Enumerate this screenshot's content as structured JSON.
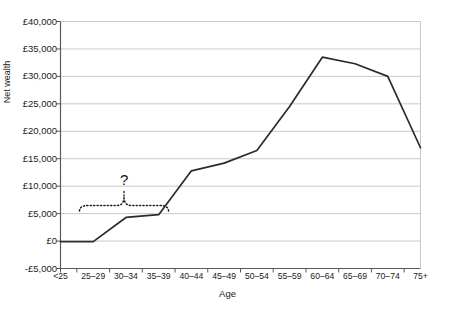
{
  "chart_data": {
    "type": "line",
    "title": "",
    "xlabel": "Age",
    "ylabel": "Net wealth",
    "categories": [
      "<25",
      "25–29",
      "30–34",
      "35–39",
      "40–44",
      "45–49",
      "50–54",
      "55–59",
      "60–64",
      "65–69",
      "70–74",
      "75+"
    ],
    "values": [
      -100,
      -100,
      4300,
      4800,
      12800,
      14200,
      16500,
      24500,
      33500,
      32300,
      30000,
      17000
    ],
    "series": [
      {
        "name": "Net wealth",
        "values": [
          -100,
          -100,
          4300,
          4800,
          12800,
          14200,
          16500,
          24500,
          33500,
          32300,
          30000,
          17000
        ]
      }
    ],
    "ylim": [
      -5000,
      40000
    ],
    "ytick_values": [
      40000,
      35000,
      30000,
      25000,
      20000,
      15000,
      10000,
      5000,
      0,
      -5000
    ],
    "ytick_labels": [
      "£40,000",
      "£35,000",
      "£30,000",
      "£25,000",
      "£20,000",
      "£15,000",
      "£10,000",
      "£5,000",
      "£0",
      "-£5,000"
    ],
    "grid": true,
    "legend": "none",
    "line_color": "#2b2b2b",
    "grid_color": "#c8c8c8",
    "axis_color": "#6b6b6b",
    "annotations": [
      {
        "label": "?",
        "type": "brace-with-question-mark",
        "style": "dotted",
        "spans_categories": [
          "25–29",
          "35–39"
        ]
      }
    ]
  },
  "axis": {
    "y_title": "Net wealth",
    "x_title": "Age"
  },
  "annotation": {
    "question_mark": "?"
  }
}
